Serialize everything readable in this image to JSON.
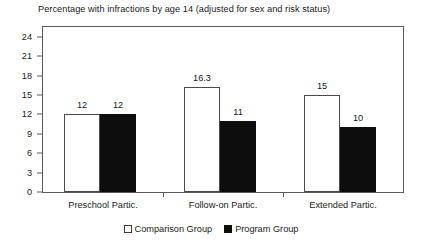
{
  "chart_data": {
    "type": "bar",
    "title": "Percentage with infractions by age 14 (adjusted for sex and risk status)",
    "xlabel": "",
    "ylabel": "",
    "categories": [
      "Preschool Partic.",
      "Follow-on Partic.",
      "Extended Partic."
    ],
    "series": [
      {
        "name": "Comparison Group",
        "color": "#ffffff",
        "values": [
          12,
          16.3,
          15
        ],
        "value_labels": [
          "12",
          "16.3",
          "15"
        ]
      },
      {
        "name": "Program Group",
        "color": "#0d0d0d",
        "values": [
          12,
          11,
          10
        ],
        "value_labels": [
          "12",
          "11",
          "10"
        ]
      }
    ],
    "ylim": [
      0,
      25.5
    ],
    "yticks": [
      0,
      3,
      6,
      9,
      12,
      15,
      18,
      21,
      24
    ],
    "ytick_labels": [
      "0",
      "3",
      "6",
      "9",
      "12",
      "15",
      "18",
      "21",
      "24"
    ],
    "grid": false,
    "legend_position": "bottom",
    "legend": [
      {
        "swatch": "open-square-swatch",
        "label": "Comparison Group"
      },
      {
        "swatch": "filled-square-swatch",
        "label": "Program Group"
      }
    ],
    "axis_color": "#5a5a5a"
  }
}
